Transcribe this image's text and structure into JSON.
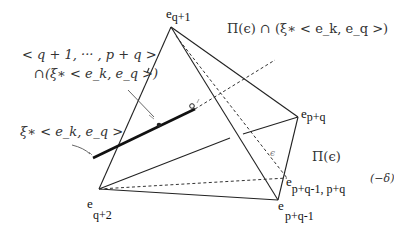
{
  "diagram": {
    "type": "tetrahedron-section-figure",
    "vertices": [
      {
        "id": "v_top",
        "label": "e",
        "sub": "q+1",
        "x": 171,
        "y": 27
      },
      {
        "id": "v_right",
        "label": "e",
        "sub": "p+q",
        "x": 298,
        "y": 117
      },
      {
        "id": "v_left",
        "label": "e",
        "sub": "q+2",
        "x": 99,
        "y": 189
      },
      {
        "id": "v_bottom",
        "label": "e",
        "sub": "p+q-1",
        "x": 278,
        "y": 200
      },
      {
        "id": "v_mid",
        "label": "e",
        "sub": "p+q-1, p+q",
        "x": 287,
        "y": 178
      }
    ],
    "labels": {
      "pi_intersection": "Π(ε) ∩ (ξ∗ < eₖ, eₓ >)",
      "pi_eps": "Π(ε)",
      "span_line1": "< q + 1, ··· , p + q >",
      "span_line2": "∩(ξ∗ < eₖ, eₓ >)",
      "xi_label": "ξ∗ < eₖ, eₓ >",
      "delta_label": "(−δ)",
      "eps_small": "ε"
    },
    "label_text": {
      "pi_intersection": "Π(ϵ) ∩ (ξ∗ < e_k, e_q >)",
      "pi_eps": "Π(ϵ)",
      "span_line1": "< q + 1, ··· , p + q >",
      "span_line2": "∩(ξ∗ < e_k, e_q >)",
      "xi_label": "ξ∗ < e_k, e_q >",
      "delta_label": "(−δ)",
      "eps_small": "ϵ"
    }
  }
}
